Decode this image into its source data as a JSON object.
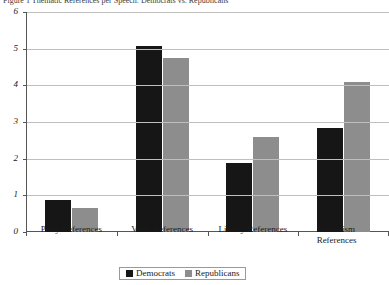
{
  "caption": {
    "prefix": "Figure 1",
    "text": "Figure 1  Thematic References per Speech: Democrats vs. Republicans"
  },
  "chart_data": {
    "type": "bar",
    "title": "",
    "xlabel": "",
    "ylabel": "",
    "categories": [
      "Party References",
      "Voter References",
      "Liberty References",
      "Patriotism References"
    ],
    "series": [
      {
        "name": "Democrats",
        "color": "#161616",
        "values": [
          0.88,
          5.08,
          1.88,
          2.85
        ]
      },
      {
        "name": "Republicans",
        "color": "#8d8d8d",
        "values": [
          0.65,
          4.75,
          2.6,
          4.1
        ]
      }
    ],
    "ylim": [
      0,
      6
    ],
    "yticks": [
      0,
      1,
      2,
      3,
      4,
      5,
      6
    ],
    "ytick_labels": [
      "0",
      "1",
      "2",
      "3",
      "4",
      "5",
      "6"
    ],
    "grid": true,
    "legend_position": "bottom"
  },
  "legend": {
    "items": [
      {
        "label": "Democrats",
        "color": "#161616"
      },
      {
        "label": "Republicans",
        "color": "#8d8d8d"
      }
    ]
  }
}
